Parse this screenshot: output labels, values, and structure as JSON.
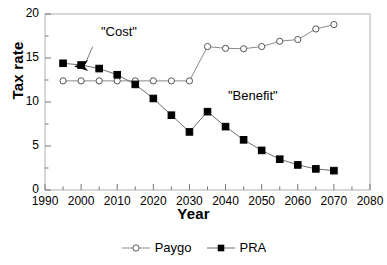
{
  "chart_data": {
    "type": "line",
    "title": "",
    "xlabel": "Year",
    "ylabel": "Tax rate",
    "xlim": [
      1990,
      2080
    ],
    "ylim": [
      0,
      20
    ],
    "xticks": [
      1990,
      2000,
      2010,
      2020,
      2030,
      2040,
      2050,
      2060,
      2070,
      2080
    ],
    "yticks": [
      0,
      5,
      10,
      15,
      20
    ],
    "xminor_step": 5,
    "yminor_step": 2.5,
    "grid": false,
    "legend_position": "bottom",
    "x": [
      1995,
      2000,
      2005,
      2010,
      2015,
      2020,
      2025,
      2030,
      2035,
      2040,
      2045,
      2050,
      2055,
      2060,
      2065,
      2070
    ],
    "series": [
      {
        "name": "Paygo",
        "marker": "open-circle",
        "color": "#000000",
        "values": [
          12.4,
          12.4,
          12.4,
          12.4,
          12.4,
          12.4,
          12.4,
          12.4,
          16.3,
          16.1,
          16.05,
          16.3,
          16.9,
          17.1,
          18.3,
          18.8
        ]
      },
      {
        "name": "PRA",
        "marker": "filled-square",
        "color": "#000000",
        "values": [
          14.4,
          14.2,
          13.8,
          13.1,
          12.0,
          10.4,
          8.5,
          6.6,
          8.9,
          7.2,
          5.7,
          4.5,
          3.5,
          2.85,
          2.4,
          2.2
        ]
      }
    ],
    "annotations": [
      {
        "text": "\"Cost\"",
        "x": 2002,
        "y": 17.2,
        "arrow_to_x": 2000,
        "arrow_to_y": 14.2
      },
      {
        "text": "\"Benefit\"",
        "x": 2043,
        "y": 10.6
      }
    ]
  },
  "legend": {
    "items": [
      {
        "label": "Paygo",
        "marker": "open-circle"
      },
      {
        "label": "PRA",
        "marker": "filled-square"
      }
    ]
  }
}
